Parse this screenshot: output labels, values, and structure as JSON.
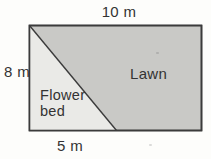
{
  "figure": {
    "labels": {
      "top_width": "10 m",
      "left_height": "8 m",
      "bottom_segment": "5 m",
      "lawn": "Lawn",
      "flower_bed_line1": "Flower",
      "flower_bed_line2": "bed"
    },
    "measurements": {
      "rectangle_width_m": 10,
      "rectangle_height_m": 8,
      "flower_bed_base_m": 5
    },
    "colors": {
      "lawn_fill": "#c9c9c6",
      "flower_bed_fill": "#eaeae7",
      "outline": "#3b3b3b",
      "text": "#333333",
      "background": "#fdfdfb"
    }
  }
}
